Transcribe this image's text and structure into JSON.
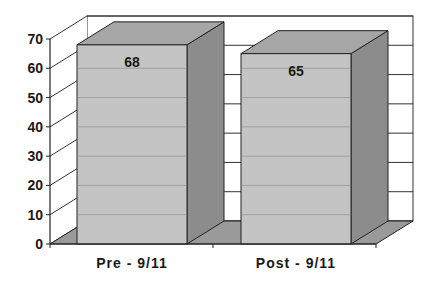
{
  "chart_data": {
    "type": "bar",
    "style": "3d-column",
    "title": "",
    "xlabel": "",
    "ylabel": "",
    "categories": [
      "Pre - 9/11",
      "Post - 9/11"
    ],
    "values": [
      68,
      65
    ],
    "data_labels": [
      "68",
      "65"
    ],
    "ylim": [
      0,
      70
    ],
    "yticks": [
      "0",
      "10",
      "20",
      "30",
      "40",
      "50",
      "60",
      "70"
    ],
    "grid": true,
    "legend": null
  },
  "colors": {
    "bar_front": "#c4c4c4",
    "bar_top": "#a6a6a6",
    "bar_side": "#8c8c8c",
    "floor": "#9a9a9a",
    "grid": "#333333"
  }
}
